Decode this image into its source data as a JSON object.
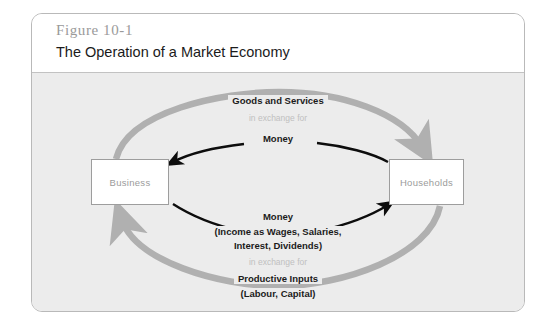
{
  "figure": {
    "number": "Figure 10-1",
    "title": "The Operation of a Market Economy"
  },
  "entities": {
    "left": "Business",
    "right": "Households"
  },
  "flows": {
    "goods_and_services": "Goods and Services",
    "in_exchange_for_top": "in exchange for",
    "money_top": "Money",
    "money_income_line1": "Money",
    "money_income_line2": "(Income as Wages, Salaries,",
    "money_income_line3": "Interest, Dividends)",
    "in_exchange_for_bottom": "in exchange for",
    "productive_inputs_line1": "Productive Inputs",
    "productive_inputs_line2": "(Labour, Capital)"
  },
  "colors": {
    "gray_arrow": "#b0b0b0",
    "black_arrow": "#0d0d0d",
    "body_background": "#ececec",
    "box_border": "#9d9d9d",
    "box_label": "#9b9b9b",
    "faint_text": "#c0c0c0",
    "figure_number": "#9a9a9a",
    "card_border": "#b9b9b9"
  }
}
